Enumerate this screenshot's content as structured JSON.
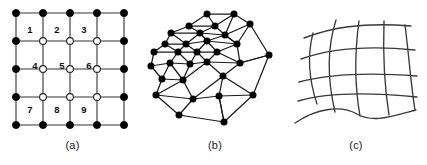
{
  "figure": {
    "background_color": "#ffffff",
    "line_color": "#333333",
    "node_fill_boundary": "#000000",
    "node_fill_interior": "#ffffff"
  },
  "panels": [
    {
      "id": "panel-a",
      "caption": "(a)",
      "kind": "structured-cartesian-grid",
      "description": "Structured uniform Cartesian grid with boundary nodes and numbered interior nodes",
      "grid": {
        "columns": 5,
        "rows": 5,
        "x_coords": [
          16,
          43,
          70,
          97,
          124
        ],
        "y_coords": [
          13,
          41,
          69,
          97,
          125
        ],
        "interior_indices": [
          1,
          2,
          3
        ]
      },
      "interior_node_labels": [
        {
          "label": "1",
          "col": 1,
          "row": 1,
          "text_x": 30,
          "text_y": 30
        },
        {
          "label": "2",
          "col": 2,
          "row": 1,
          "text_x": 57,
          "text_y": 30
        },
        {
          "label": "3",
          "col": 3,
          "row": 1,
          "text_x": 84,
          "text_y": 30
        },
        {
          "label": "4",
          "col": 1,
          "row": 2,
          "text_x": 35,
          "text_y": 66
        },
        {
          "label": "5",
          "col": 2,
          "row": 2,
          "text_x": 62,
          "text_y": 66
        },
        {
          "label": "6",
          "col": 3,
          "row": 2,
          "text_x": 89,
          "text_y": 66
        },
        {
          "label": "7",
          "col": 1,
          "row": 3,
          "text_x": 30,
          "text_y": 110
        },
        {
          "label": "8",
          "col": 2,
          "row": 3,
          "text_x": 57,
          "text_y": 110
        },
        {
          "label": "9",
          "col": 3,
          "row": 3,
          "text_x": 84,
          "text_y": 110
        }
      ],
      "boundary_node_radius": 3.6,
      "interior_node_radius": 3.4
    },
    {
      "id": "panel-b",
      "caption": "(b)",
      "kind": "unstructured-triangular-mesh",
      "description": "Unstructured triangular (Delaunay-type) mesh with filled nodes",
      "node_radius": 3.5,
      "node_count": 28,
      "nodes": [
        [
          62,
          14
        ],
        [
          89,
          14
        ],
        [
          44,
          26
        ],
        [
          70,
          26
        ],
        [
          105,
          24
        ],
        [
          26,
          33
        ],
        [
          55,
          33
        ],
        [
          80,
          35
        ],
        [
          20,
          44
        ],
        [
          41,
          44
        ],
        [
          62,
          41
        ],
        [
          92,
          44
        ],
        [
          9,
          52
        ],
        [
          33,
          52
        ],
        [
          52,
          52
        ],
        [
          72,
          52
        ],
        [
          6,
          66
        ],
        [
          25,
          63
        ],
        [
          45,
          64
        ],
        [
          62,
          62
        ],
        [
          95,
          63
        ],
        [
          124,
          55
        ],
        [
          17,
          79
        ],
        [
          38,
          80
        ],
        [
          78,
          76
        ],
        [
          11,
          95
        ],
        [
          48,
          99
        ],
        [
          74,
          96
        ],
        [
          108,
          95
        ],
        [
          34,
          115
        ],
        [
          79,
          122
        ]
      ],
      "edges": [
        [
          0,
          1
        ],
        [
          0,
          3
        ],
        [
          0,
          2
        ],
        [
          1,
          4
        ],
        [
          1,
          3
        ],
        [
          1,
          7
        ],
        [
          2,
          3
        ],
        [
          2,
          5
        ],
        [
          2,
          6
        ],
        [
          3,
          7
        ],
        [
          3,
          6
        ],
        [
          4,
          7
        ],
        [
          4,
          11
        ],
        [
          4,
          21
        ],
        [
          5,
          6
        ],
        [
          5,
          8
        ],
        [
          5,
          9
        ],
        [
          6,
          9
        ],
        [
          6,
          10
        ],
        [
          6,
          7
        ],
        [
          7,
          10
        ],
        [
          7,
          11
        ],
        [
          8,
          9
        ],
        [
          8,
          12
        ],
        [
          8,
          13
        ],
        [
          9,
          10
        ],
        [
          9,
          13
        ],
        [
          9,
          14
        ],
        [
          10,
          14
        ],
        [
          10,
          15
        ],
        [
          10,
          11
        ],
        [
          11,
          15
        ],
        [
          11,
          20
        ],
        [
          12,
          13
        ],
        [
          12,
          16
        ],
        [
          13,
          14
        ],
        [
          13,
          17
        ],
        [
          13,
          18
        ],
        [
          14,
          15
        ],
        [
          14,
          18
        ],
        [
          14,
          19
        ],
        [
          15,
          19
        ],
        [
          15,
          20
        ],
        [
          16,
          17
        ],
        [
          16,
          22
        ],
        [
          17,
          18
        ],
        [
          17,
          22
        ],
        [
          17,
          23
        ],
        [
          18,
          19
        ],
        [
          18,
          23
        ],
        [
          19,
          23
        ],
        [
          19,
          24
        ],
        [
          19,
          20
        ],
        [
          20,
          24
        ],
        [
          20,
          21
        ],
        [
          21,
          28
        ],
        [
          22,
          23
        ],
        [
          22,
          25
        ],
        [
          23,
          26
        ],
        [
          23,
          25
        ],
        [
          24,
          27
        ],
        [
          24,
          28
        ],
        [
          24,
          26
        ],
        [
          25,
          26
        ],
        [
          25,
          29
        ],
        [
          26,
          27
        ],
        [
          26,
          29
        ],
        [
          27,
          28
        ],
        [
          27,
          30
        ],
        [
          29,
          30
        ],
        [
          30,
          27
        ],
        [
          28,
          30
        ],
        [
          21,
          20
        ],
        [
          11,
          7
        ]
      ]
    },
    {
      "id": "panel-c",
      "caption": "(c)",
      "kind": "curvilinear-body-fitted-grid",
      "description": "Curvilinear (body-fitted) structured grid made of smooth curved coordinate lines",
      "vertical_curve_count": 5,
      "horizontal_curve_count": 5,
      "curves_vertical": [
        "M 28,33 C 22,56 24,80 32,104",
        "M 51,20 C 42,48 42,78 50,112",
        "M 74,21 C 70,50 69,82 75,116",
        "M 99,21 C 98,52 99,84 104,115",
        "M 120,25 C 124,56 126,86 130,110"
      ],
      "curves_horizontal": [
        "M 19,38 C 45,28 76,22 126,26",
        "M 16,59 C 44,49 80,45 130,50",
        "M 14,82 C 44,74 82,72 132,76",
        "M 13,101 C 40,93 82,92 132,97",
        "M 10,123 C 32,108 56,105 72,114 C 88,123 104,117 131,110"
      ]
    }
  ]
}
